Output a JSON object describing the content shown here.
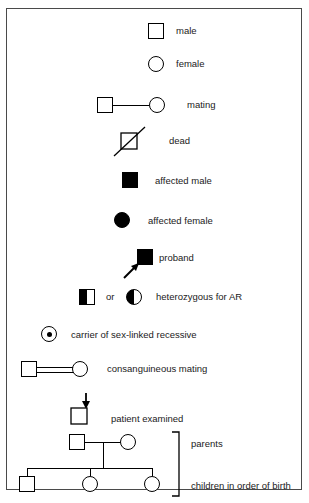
{
  "diagram": {
    "stroke_color": "#000000",
    "fill_color": "#000000",
    "background_color": "#ffffff",
    "border_color": "#4a4a4a"
  },
  "entries": [
    {
      "id": "male",
      "label": "male",
      "symbol": "open-square"
    },
    {
      "id": "female",
      "label": "female",
      "symbol": "open-circle"
    },
    {
      "id": "mating",
      "label": "mating",
      "symbol": "square-line-circle"
    },
    {
      "id": "dead",
      "label": "dead",
      "symbol": "square-with-diagonal-slash"
    },
    {
      "id": "affected-male",
      "label": "affected male",
      "symbol": "filled-square"
    },
    {
      "id": "affected-female",
      "label": "affected female",
      "symbol": "filled-circle"
    },
    {
      "id": "proband",
      "label": "proband",
      "symbol": "filled-square-with-arrow"
    },
    {
      "id": "heterozygous",
      "label": "heterozygous for AR",
      "conjunction": "or",
      "symbol": "half-filled-square-or-half-filled-circle"
    },
    {
      "id": "carrier",
      "label": "carrier of sex-linked recessive",
      "symbol": "circle-with-center-dot"
    },
    {
      "id": "consanguineous",
      "label": "consanguineous mating",
      "symbol": "square-double-line-circle"
    },
    {
      "id": "patient-examined",
      "label": "patient examined",
      "symbol": "square-with-down-arrow"
    }
  ],
  "family": {
    "parents_label": "parents",
    "children_label": "children in order of birth",
    "parents": [
      {
        "sex": "male",
        "symbol": "open-square"
      },
      {
        "sex": "female",
        "symbol": "open-circle"
      }
    ],
    "children": [
      {
        "sex": "male",
        "symbol": "open-square"
      },
      {
        "sex": "female",
        "symbol": "open-circle"
      },
      {
        "sex": "female",
        "symbol": "open-circle"
      }
    ]
  }
}
